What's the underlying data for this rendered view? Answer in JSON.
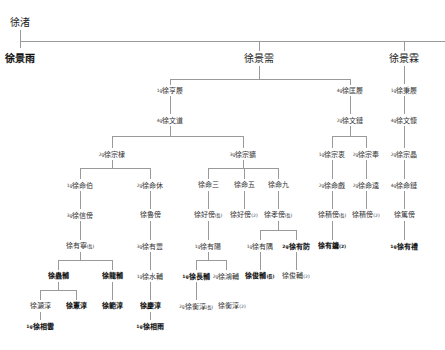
{
  "title": "徐渚",
  "nodes": [
    {
      "id": "root",
      "pre": "",
      "name": "徐渚",
      "suf": "",
      "x": 20,
      "y": 17,
      "big": true,
      "bold": false
    },
    {
      "id": "g1a",
      "pre": "",
      "name": "徐景雨",
      "suf": "",
      "x": 20,
      "y": 53,
      "big": true,
      "bold": true
    },
    {
      "id": "g1b",
      "pre": "",
      "name": "徐景需",
      "suf": "",
      "x": 259,
      "y": 53,
      "big": true,
      "bold": false
    },
    {
      "id": "g1c",
      "pre": "",
      "name": "徐景霖",
      "suf": "",
      "x": 404,
      "y": 53,
      "big": true,
      "bold": false
    },
    {
      "id": "g2a",
      "pre": "1g",
      "name": "徐亨履",
      "suf": "",
      "x": 170,
      "y": 86
    },
    {
      "id": "g2b",
      "pre": "4g",
      "name": "徐匡履",
      "suf": "",
      "x": 350,
      "y": 86
    },
    {
      "id": "g2c",
      "pre": "1g",
      "name": "徐秉履",
      "suf": "",
      "x": 404,
      "y": 86
    },
    {
      "id": "g3a",
      "pre": "4g",
      "name": "徐文道",
      "suf": "",
      "x": 170,
      "y": 116
    },
    {
      "id": "g3b",
      "pre": "2g",
      "name": "徐文鏈",
      "suf": "",
      "x": 350,
      "y": 116
    },
    {
      "id": "g3c",
      "pre": "4g",
      "name": "徐文慷",
      "suf": "",
      "x": 404,
      "y": 116
    },
    {
      "id": "g4a",
      "pre": "2g",
      "name": "徐宗棣",
      "suf": "",
      "x": 112,
      "y": 150
    },
    {
      "id": "g4b",
      "pre": "3g",
      "name": "徐宗獷",
      "suf": "",
      "x": 243,
      "y": 150
    },
    {
      "id": "g4c",
      "pre": "1g",
      "name": "徐宗衷",
      "suf": "",
      "x": 332,
      "y": 150
    },
    {
      "id": "g4d",
      "pre": "2g",
      "name": "徐宗奉",
      "suf": "",
      "x": 366,
      "y": 150
    },
    {
      "id": "g4e",
      "pre": "2g",
      "name": "徐宗晶",
      "suf": "",
      "x": 404,
      "y": 150
    },
    {
      "id": "g5a",
      "pre": "1g",
      "name": "徐命伯",
      "suf": "",
      "x": 80,
      "y": 181
    },
    {
      "id": "g5b",
      "pre": "2g",
      "name": "徐命休",
      "suf": "",
      "x": 150,
      "y": 181
    },
    {
      "id": "g5c",
      "pre": "",
      "name": "徐命三",
      "suf": "",
      "x": 208,
      "y": 181
    },
    {
      "id": "g5d",
      "pre": "",
      "name": "徐命五",
      "suf": "",
      "x": 244,
      "y": 181
    },
    {
      "id": "g5e",
      "pre": "",
      "name": "徐命九",
      "suf": "",
      "x": 278,
      "y": 181
    },
    {
      "id": "g5f",
      "pre": "2g",
      "name": "徐命戲",
      "suf": "",
      "x": 332,
      "y": 181
    },
    {
      "id": "g5g",
      "pre": "2g",
      "name": "徐命逵",
      "suf": "",
      "x": 366,
      "y": 181
    },
    {
      "id": "g5h",
      "pre": "4g",
      "name": "徐命鏈",
      "suf": "",
      "x": 404,
      "y": 181
    },
    {
      "id": "g6a",
      "pre": "3g",
      "name": "徐信傍",
      "suf": "",
      "x": 80,
      "y": 211
    },
    {
      "id": "g6b",
      "pre": "",
      "name": "徐魯傍",
      "suf": "",
      "x": 150,
      "y": 211
    },
    {
      "id": "g6c",
      "pre": "",
      "name": "徐好傍",
      "suf": "(長)",
      "x": 208,
      "y": 211
    },
    {
      "id": "g6d",
      "pre": "",
      "name": "徐好傍",
      "suf": "(2)",
      "x": 244,
      "y": 211
    },
    {
      "id": "g6e",
      "pre": "",
      "name": "徐孝傍",
      "suf": "(長)",
      "x": 278,
      "y": 211
    },
    {
      "id": "g6f",
      "pre": "",
      "name": "徐積傍",
      "suf": "(長)",
      "x": 332,
      "y": 211
    },
    {
      "id": "g6g",
      "pre": "",
      "name": "徐積傍",
      "suf": "(2)",
      "x": 366,
      "y": 211
    },
    {
      "id": "g6h",
      "pre": "",
      "name": "徐篤傍",
      "suf": "",
      "x": 404,
      "y": 211
    },
    {
      "id": "g7a",
      "pre": "",
      "name": "徐有寧",
      "suf": "(長)",
      "x": 80,
      "y": 242
    },
    {
      "id": "g7b",
      "pre": "3g",
      "name": "徐有豐",
      "suf": "",
      "x": 150,
      "y": 242
    },
    {
      "id": "g7c",
      "pre": "1g",
      "name": "徐有陽",
      "suf": "",
      "x": 208,
      "y": 242
    },
    {
      "id": "g7d",
      "pre": "1g",
      "name": "徐有隅",
      "suf": "",
      "x": 260,
      "y": 242
    },
    {
      "id": "g7e",
      "pre": "2g",
      "name": "徐有防",
      "suf": "",
      "x": 296,
      "y": 242,
      "bold": true
    },
    {
      "id": "g7f",
      "pre": "",
      "name": "徐有鏞",
      "suf": "(2)",
      "x": 332,
      "y": 242,
      "bold": true
    },
    {
      "id": "g7g",
      "pre": "1g",
      "name": "徐有禮",
      "suf": "",
      "x": 404,
      "y": 242,
      "bold": true
    },
    {
      "id": "g8a",
      "pre": "",
      "name": "徐蟲輔",
      "suf": "",
      "x": 58,
      "y": 272,
      "bold": true
    },
    {
      "id": "g8b",
      "pre": "",
      "name": "徐龍輔",
      "suf": "",
      "x": 112,
      "y": 272,
      "bold": true
    },
    {
      "id": "g8c",
      "pre": "1g",
      "name": "徐水輔",
      "suf": "",
      "x": 150,
      "y": 272
    },
    {
      "id": "g8d",
      "pre": "1g",
      "name": "徐長輔",
      "suf": "",
      "x": 196,
      "y": 272,
      "bold": true
    },
    {
      "id": "g8e",
      "pre": "2g",
      "name": "徐鴻輔",
      "suf": "",
      "x": 226,
      "y": 272
    },
    {
      "id": "g8f",
      "pre": "",
      "name": "徐俊輔",
      "suf": "(長)",
      "x": 260,
      "y": 272,
      "bold": true
    },
    {
      "id": "g8g",
      "pre": "",
      "name": "徐俊輔",
      "suf": "(2)",
      "x": 296,
      "y": 272
    },
    {
      "id": "g9a",
      "pre": "",
      "name": "徐灝淳",
      "suf": "",
      "x": 40,
      "y": 302
    },
    {
      "id": "g9b",
      "pre": "",
      "name": "徐憲淳",
      "suf": "",
      "x": 76,
      "y": 302,
      "bold": true
    },
    {
      "id": "g9c",
      "pre": "",
      "name": "徐範淳",
      "suf": "",
      "x": 112,
      "y": 302,
      "bold": true
    },
    {
      "id": "g9d",
      "pre": "",
      "name": "徐慶淳",
      "suf": "",
      "x": 150,
      "y": 302,
      "bold": true
    },
    {
      "id": "g9e",
      "pre": "2g",
      "name": "徐衡淳",
      "suf": "(長)",
      "x": 196,
      "y": 302
    },
    {
      "id": "g9f",
      "pre": "",
      "name": "徐衡淳",
      "suf": "(2)",
      "x": 232,
      "y": 302
    },
    {
      "id": "g10a",
      "pre": "1g",
      "name": "徐相雲",
      "suf": "",
      "x": 40,
      "y": 322,
      "bold": true
    },
    {
      "id": "g10b",
      "pre": "1g",
      "name": "徐相雨",
      "suf": "",
      "x": 150,
      "y": 322,
      "bold": true
    }
  ],
  "lines": [
    [
      20,
      30,
      1,
      18
    ],
    [
      20,
      41,
      425,
      1
    ],
    [
      259,
      41,
      1,
      10
    ],
    [
      404,
      41,
      1,
      10
    ],
    [
      259,
      66,
      1,
      14
    ],
    [
      170,
      79,
      180,
      1
    ],
    [
      170,
      79,
      1,
      6
    ],
    [
      350,
      79,
      1,
      6
    ],
    [
      404,
      66,
      1,
      18
    ],
    [
      170,
      96,
      1,
      18
    ],
    [
      350,
      96,
      1,
      18
    ],
    [
      404,
      96,
      1,
      18
    ],
    [
      170,
      126,
      1,
      10
    ],
    [
      112,
      136,
      131,
      1
    ],
    [
      112,
      136,
      1,
      12
    ],
    [
      243,
      136,
      1,
      12
    ],
    [
      350,
      126,
      1,
      10
    ],
    [
      332,
      136,
      34,
      1
    ],
    [
      332,
      136,
      1,
      12
    ],
    [
      366,
      136,
      1,
      12
    ],
    [
      404,
      126,
      1,
      22
    ],
    [
      112,
      160,
      1,
      8
    ],
    [
      80,
      168,
      70,
      1
    ],
    [
      80,
      168,
      1,
      11
    ],
    [
      150,
      168,
      1,
      11
    ],
    [
      243,
      160,
      1,
      8
    ],
    [
      208,
      168,
      70,
      1
    ],
    [
      208,
      168,
      1,
      11
    ],
    [
      244,
      168,
      1,
      11
    ],
    [
      278,
      168,
      1,
      11
    ],
    [
      332,
      160,
      1,
      19
    ],
    [
      366,
      160,
      1,
      19
    ],
    [
      404,
      160,
      1,
      19
    ],
    [
      80,
      191,
      1,
      18
    ],
    [
      150,
      191,
      1,
      18
    ],
    [
      208,
      191,
      1,
      18
    ],
    [
      244,
      191,
      1,
      18
    ],
    [
      278,
      191,
      1,
      18
    ],
    [
      332,
      191,
      1,
      18
    ],
    [
      366,
      191,
      1,
      18
    ],
    [
      404,
      191,
      1,
      18
    ],
    [
      80,
      221,
      1,
      19
    ],
    [
      150,
      221,
      1,
      19
    ],
    [
      208,
      221,
      1,
      19
    ],
    [
      278,
      221,
      1,
      9
    ],
    [
      260,
      230,
      36,
      1
    ],
    [
      260,
      230,
      1,
      10
    ],
    [
      296,
      230,
      1,
      10
    ],
    [
      332,
      221,
      1,
      19
    ],
    [
      404,
      221,
      1,
      19
    ],
    [
      80,
      252,
      1,
      8
    ],
    [
      58,
      260,
      54,
      1
    ],
    [
      58,
      260,
      1,
      10
    ],
    [
      112,
      260,
      1,
      10
    ],
    [
      150,
      252,
      1,
      18
    ],
    [
      208,
      252,
      1,
      8
    ],
    [
      196,
      260,
      30,
      1
    ],
    [
      196,
      260,
      1,
      10
    ],
    [
      226,
      260,
      1,
      10
    ],
    [
      260,
      252,
      1,
      18
    ],
    [
      296,
      252,
      1,
      18
    ],
    [
      58,
      282,
      1,
      8
    ],
    [
      40,
      290,
      36,
      1
    ],
    [
      40,
      290,
      1,
      10
    ],
    [
      76,
      290,
      1,
      10
    ],
    [
      112,
      282,
      1,
      18
    ],
    [
      150,
      282,
      1,
      18
    ],
    [
      196,
      282,
      1,
      18
    ],
    [
      40,
      312,
      1,
      8
    ],
    [
      150,
      312,
      1,
      8
    ]
  ]
}
